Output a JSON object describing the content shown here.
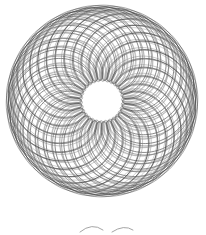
{
  "image": {
    "description": "Hand-drawn style spirograph rosette of overlapping gray looping curves with a small open center, plus a faint partial curve fragment below",
    "background": "#ffffff",
    "stroke_color": "#3a3a3a",
    "stroke_color_light": "#8a8a8a"
  },
  "rosette": {
    "cx": 102,
    "cy": 101,
    "outer_radius": 94,
    "R": 60,
    "r": 26,
    "d": 38,
    "turns": 13,
    "passes": [
      {
        "rot": 0,
        "scale": 1.0,
        "opacity": 0.75
      },
      {
        "rot": 7,
        "scale": 0.97,
        "opacity": 0.6
      },
      {
        "rot": 14,
        "scale": 1.02,
        "opacity": 0.55
      },
      {
        "rot": 21,
        "scale": 0.95,
        "opacity": 0.5
      }
    ]
  },
  "fragment": {
    "paths": [
      "M80 232 Q92 222 103 230",
      "M112 232 Q124 224 133 230"
    ]
  }
}
